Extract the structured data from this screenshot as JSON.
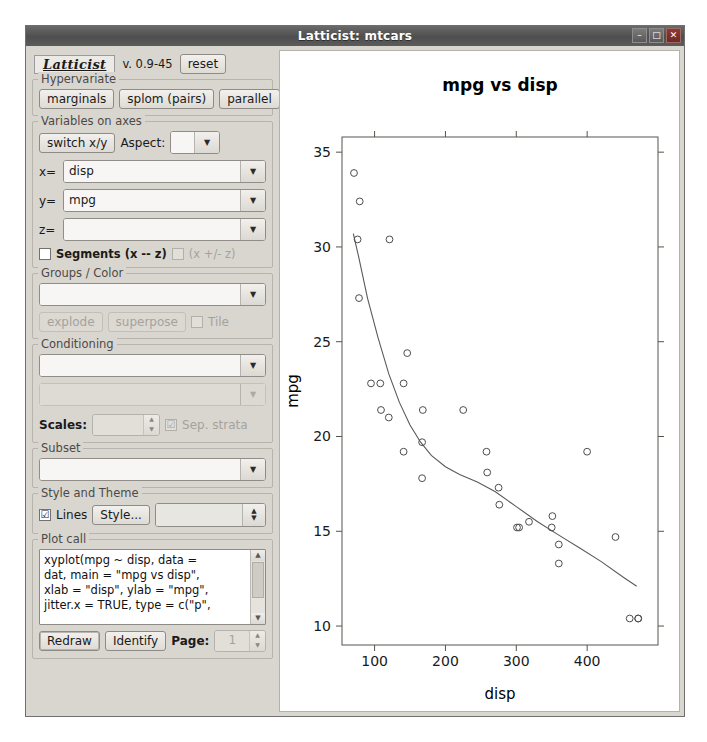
{
  "window": {
    "title": "Latticist: mtcars",
    "buttons": {
      "minimize": "–",
      "maximize": "□",
      "close": "✕"
    }
  },
  "sidebar": {
    "logo": "Latticist",
    "version": "v. 0.9-45",
    "reset_label": "reset",
    "hypervariate": {
      "legend": "Hypervariate",
      "marginals": "marginals",
      "splom": "splom (pairs)",
      "parallel": "parallel"
    },
    "axes": {
      "legend": "Variables on axes",
      "switch_label": "switch x/y",
      "aspect_label": "Aspect:",
      "aspect_value": "",
      "x_label": "x=",
      "x_value": "disp",
      "y_label": "y=",
      "y_value": "mpg",
      "z_label": "z=",
      "z_value": "",
      "segments_label": "Segments (x -- z)",
      "segments_checked": "",
      "pm_label": "(x +/- z)",
      "pm_checked": ""
    },
    "groups": {
      "legend": "Groups / Color",
      "value": "",
      "explode": "explode",
      "superpose": "superpose",
      "tile_label": "Tile",
      "tile_checked": ""
    },
    "conditioning": {
      "legend": "Conditioning",
      "value1": "",
      "value2": "",
      "scales_label": "Scales:",
      "scales_value": "",
      "sep_strata_label": "Sep. strata",
      "sep_strata_checked": "☑"
    },
    "subset": {
      "legend": "Subset",
      "value": ""
    },
    "style": {
      "legend": "Style and Theme",
      "lines_label": "Lines",
      "lines_checked": "☑",
      "style_button": "Style...",
      "theme_value": ""
    },
    "plotcall": {
      "legend": "Plot call",
      "text": "xyplot(mpg ~ disp, data =\ndat, main = \"mpg vs disp\",\nxlab = \"disp\", ylab = \"mpg\",\njitter.x = TRUE, type = c(\"p\","
    },
    "actions": {
      "redraw": "Redraw",
      "identify": "Identify",
      "page_label": "Page:",
      "page_value": "1"
    }
  },
  "chart_data": {
    "type": "scatter",
    "title": "mpg vs disp",
    "xlabel": "disp",
    "ylabel": "mpg",
    "subtitle": "N = 32, 2010-04-05, R 2.12.0Under development (unstable)",
    "xlim": [
      54,
      500
    ],
    "ylim": [
      9.0,
      35.8
    ],
    "xticks": [
      100,
      200,
      300,
      400
    ],
    "yticks": [
      10,
      15,
      20,
      25,
      30,
      35
    ],
    "grid": false,
    "legend": "none",
    "point_symbol": "open-circle",
    "point_color": "#4d4d4d",
    "line_color": "#5a5a5a",
    "series": [
      {
        "name": "mtcars",
        "x": [
          71,
          79,
          76,
          121,
          95,
          109,
          108,
          78,
          146,
          141,
          120,
          141,
          167,
          168,
          167,
          225,
          258,
          259,
          275,
          276,
          301,
          304,
          318,
          350,
          351,
          360,
          360,
          400,
          440,
          460,
          472,
          472
        ],
        "y": [
          33.9,
          32.4,
          30.4,
          30.4,
          22.8,
          21.4,
          22.8,
          27.3,
          24.4,
          22.8,
          21.0,
          19.2,
          17.8,
          21.4,
          19.7,
          21.4,
          19.2,
          18.1,
          17.3,
          16.4,
          15.2,
          15.2,
          15.5,
          15.2,
          15.8,
          14.3,
          13.3,
          19.2,
          14.7,
          10.4,
          10.4,
          10.4
        ]
      }
    ],
    "smooth": {
      "name": "loess",
      "x": [
        70,
        78,
        90,
        105,
        120,
        135,
        150,
        165,
        180,
        200,
        220,
        245,
        270,
        300,
        330,
        360,
        390,
        420,
        450,
        470
      ],
      "y": [
        30.7,
        29.4,
        27.3,
        25.2,
        23.3,
        21.8,
        20.6,
        19.7,
        19.0,
        18.4,
        18.0,
        17.6,
        17.1,
        16.3,
        15.5,
        14.8,
        14.1,
        13.4,
        12.6,
        12.1
      ]
    }
  }
}
